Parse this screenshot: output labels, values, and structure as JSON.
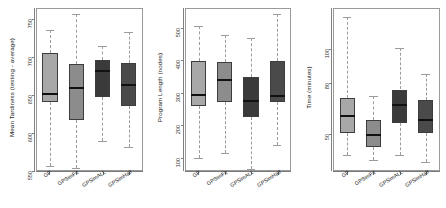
{
  "figure": {
    "type": "boxplot-panels",
    "panel_count": 3,
    "background": "#ffffff",
    "frame_color": "#9a9a9a",
    "whisker_style": "dashed",
    "group_colors": [
      "#a8a8a8",
      "#8c8c8c",
      "#3a3a3a",
      "#4a4a4a"
    ]
  },
  "chart_data": [
    {
      "type": "box",
      "title": "",
      "xlabel": "",
      "ylabel": "Mean Tardiness (testing - average)",
      "ylim": [
        550,
        765
      ],
      "yticks": [
        550,
        600,
        650,
        700,
        750
      ],
      "ytick_labels": [
        "550",
        "600",
        "650",
        "700",
        "750"
      ],
      "grid": false,
      "legend": "none",
      "categories": [
        "GP",
        "GPSimFit",
        "GPSimALL",
        "GPSimHalf"
      ],
      "boxes": [
        {
          "label": "GP",
          "min": 555,
          "q1": 641,
          "median": 651,
          "q3": 706,
          "max": 737,
          "color": "#a8a8a8"
        },
        {
          "label": "GPSimFit",
          "min": 553,
          "q1": 617,
          "median": 659,
          "q3": 691,
          "max": 758,
          "color": "#8c8c8c"
        },
        {
          "label": "GPSimALL",
          "min": 589,
          "q1": 648,
          "median": 682,
          "q3": 697,
          "max": 716,
          "color": "#3a3a3a"
        },
        {
          "label": "GPSimHalf",
          "min": 581,
          "q1": 636,
          "median": 664,
          "q3": 693,
          "max": 734,
          "color": "#4a4a4a"
        }
      ]
    },
    {
      "type": "box",
      "title": "",
      "xlabel": "",
      "ylabel": "Program Length (nodes)",
      "ylim": [
        60,
        560
      ],
      "yticks": [
        100,
        200,
        300,
        400,
        500
      ],
      "ytick_labels": [
        "100",
        "200",
        "300",
        "400",
        "500"
      ],
      "grid": false,
      "legend": "none",
      "categories": [
        "GP",
        "GPSimFit",
        "GPSimALL",
        "GPSimHalf"
      ],
      "boxes": [
        {
          "label": "GP",
          "min": 98,
          "q1": 258,
          "median": 292,
          "q3": 400,
          "max": 508,
          "color": "#a8a8a8"
        },
        {
          "label": "GPSimFit",
          "min": 112,
          "q1": 272,
          "median": 338,
          "q3": 396,
          "max": 479,
          "color": "#8c8c8c"
        },
        {
          "label": "GPSimALL",
          "min": 62,
          "q1": 226,
          "median": 273,
          "q3": 350,
          "max": 470,
          "color": "#3a3a3a"
        },
        {
          "label": "GPSimHalf",
          "min": 138,
          "q1": 271,
          "median": 290,
          "q3": 398,
          "max": 546,
          "color": "#4a4a4a"
        }
      ]
    },
    {
      "type": "box",
      "title": "",
      "xlabel": "",
      "ylabel": "Time (minutes)",
      "ylim": [
        28,
        124
      ],
      "yticks": [
        50,
        80,
        100
      ],
      "ytick_labels": [
        "50",
        "80",
        "100"
      ],
      "grid": false,
      "legend": "none",
      "categories": [
        "GP",
        "GPSimFit",
        "GPSimALL",
        "GPSimHalf"
      ],
      "boxes": [
        {
          "label": "GP",
          "min": 37,
          "q1": 50,
          "median": 60,
          "q3": 71,
          "max": 119,
          "color": "#a8a8a8"
        },
        {
          "label": "GPSimFit",
          "min": 34,
          "q1": 42,
          "median": 49,
          "q3": 58,
          "max": 72,
          "color": "#8c8c8c"
        },
        {
          "label": "GPSimALL",
          "min": 37,
          "q1": 56,
          "median": 67,
          "q3": 76,
          "max": 101,
          "color": "#3a3a3a"
        },
        {
          "label": "GPSimHalf",
          "min": 33,
          "q1": 50,
          "median": 58,
          "q3": 70,
          "max": 85,
          "color": "#4a4a4a"
        }
      ]
    }
  ]
}
